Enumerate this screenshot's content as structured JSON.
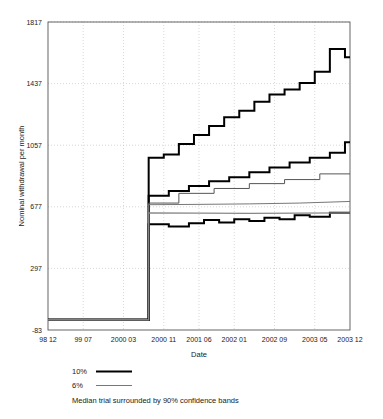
{
  "chart_data": {
    "type": "line",
    "title": "",
    "xlabel": "Date",
    "ylabel": "Nominal withdrawal per month",
    "ylim": [
      -83,
      1817
    ],
    "yticks": [
      -83,
      297,
      677,
      1057,
      1437,
      1817
    ],
    "ytick_labels": [
      "-83",
      "297",
      "677",
      "1057",
      "1437",
      "1817"
    ],
    "xtick_labels": [
      "98 12",
      "99 07",
      "2000 03",
      "2000 11",
      "2001 06",
      "2002 01",
      "2002 09",
      "2003 05",
      "2003 12"
    ],
    "x_index_range": [
      0,
      60
    ],
    "xticks_index": [
      0,
      7,
      15,
      23,
      30,
      37,
      45,
      53,
      60
    ],
    "grid": true,
    "legend_position": "below-axes",
    "series": [
      {
        "name": "10% upper band",
        "label": "10%",
        "color": "#000000",
        "width": 2.0,
        "style": "step",
        "x": [
          0,
          20,
          20,
          23,
          23,
          26,
          26,
          29,
          29,
          32,
          32,
          35,
          35,
          38,
          38,
          41,
          41,
          44,
          44,
          47,
          47,
          50,
          50,
          53,
          53,
          56,
          56,
          59,
          59,
          60
        ],
        "y": [
          -20,
          -20,
          980,
          980,
          1000,
          1000,
          1065,
          1065,
          1120,
          1120,
          1175,
          1175,
          1230,
          1230,
          1270,
          1270,
          1325,
          1325,
          1370,
          1370,
          1400,
          1400,
          1440,
          1440,
          1510,
          1510,
          1650,
          1650,
          1600,
          1600
        ]
      },
      {
        "name": "10% median",
        "label": "10%",
        "color": "#000000",
        "width": 2.0,
        "style": "step",
        "x": [
          0,
          20,
          20,
          24,
          24,
          28,
          28,
          32,
          32,
          36,
          36,
          40,
          40,
          44,
          44,
          48,
          48,
          52,
          52,
          56,
          56,
          59,
          59,
          60
        ],
        "y": [
          -20,
          -20,
          745,
          745,
          775,
          775,
          805,
          805,
          835,
          835,
          860,
          860,
          890,
          890,
          920,
          920,
          950,
          950,
          980,
          980,
          1010,
          1010,
          1075,
          1075
        ]
      },
      {
        "name": "10% lower band",
        "label": "10%",
        "color": "#000000",
        "width": 2.0,
        "style": "step",
        "x": [
          0,
          20,
          20,
          24,
          24,
          28,
          28,
          31,
          31,
          34,
          34,
          37,
          37,
          40,
          40,
          43,
          43,
          46,
          46,
          49,
          49,
          52,
          52,
          56,
          56,
          60
        ],
        "y": [
          -20,
          -20,
          570,
          570,
          555,
          555,
          575,
          575,
          595,
          595,
          580,
          580,
          600,
          600,
          590,
          590,
          610,
          610,
          600,
          600,
          625,
          625,
          615,
          615,
          640,
          640
        ]
      },
      {
        "name": "6% upper band",
        "label": "6%",
        "color": "#555555",
        "width": 1.0,
        "style": "step",
        "x": [
          0,
          20,
          20,
          26,
          26,
          33,
          33,
          40,
          40,
          47,
          47,
          54,
          54,
          60
        ],
        "y": [
          -20,
          -20,
          700,
          700,
          760,
          760,
          790,
          790,
          820,
          820,
          845,
          845,
          880,
          880
        ]
      },
      {
        "name": "6% median",
        "label": "6%",
        "color": "#777777",
        "width": 1.0,
        "style": "line",
        "x": [
          0,
          20,
          20,
          30,
          40,
          50,
          60
        ],
        "y": [
          -20,
          -20,
          690,
          692,
          695,
          700,
          710
        ]
      },
      {
        "name": "6% lower band",
        "label": "6%",
        "color": "#888888",
        "width": 1.2,
        "style": "line",
        "x": [
          0,
          20,
          20,
          30,
          40,
          50,
          60
        ],
        "y": [
          -20,
          -20,
          640,
          638,
          637,
          638,
          640
        ]
      }
    ]
  },
  "legend": {
    "entries": [
      {
        "label": "10%",
        "color": "#000000",
        "width": 2.2
      },
      {
        "label": "6%",
        "color": "#777777",
        "width": 1.0
      }
    ],
    "caption": "Median trial surrounded by 90% confidence bands"
  }
}
